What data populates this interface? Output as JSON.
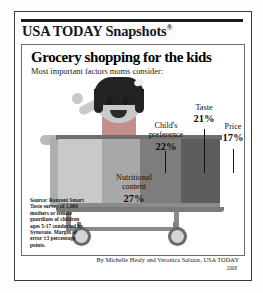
{
  "brand": {
    "logo_text": "USA TODAY Snapshots",
    "registered_mark": "®"
  },
  "headline": "Grocery shopping for the kids",
  "subhead": "Most important factors moms consider:",
  "labels": {
    "nutritional": {
      "line1": "Nutritional",
      "line2": "content",
      "percent": "27%"
    },
    "childs": {
      "line1": "Child's",
      "line2": "preference",
      "percent": "22%"
    },
    "taste": {
      "line1": "Taste",
      "percent": "21%"
    },
    "price": {
      "line1": "Price",
      "percent": "17%"
    }
  },
  "source": "Source: Ronzoni Smart Taste survey of 1,000 mothers or female guardians of children ages 5-17 conducted by Synovate. Margin of error ±3 percentage points.",
  "byline": "By Michelle Healy and Veronica Salazar, USA TODAY",
  "year": "2008",
  "chart_data": {
    "type": "bar",
    "title": "Grocery shopping for the kids",
    "subtitle": "Most important factors moms consider:",
    "categories": [
      "Nutritional content",
      "Child's preference",
      "Taste",
      "Price"
    ],
    "values": [
      27,
      22,
      21,
      17
    ],
    "value_labels": [
      "27%",
      "22%",
      "21%",
      "17%"
    ],
    "unit": "percent",
    "xlabel": "",
    "ylabel": "",
    "ylim": [
      0,
      30
    ],
    "grid": false,
    "legend": "none",
    "orientation": "illustrated-shopping-cart-segments",
    "series_colors": [
      "#c9c9c9",
      "#a8a8a8",
      "#7d7d7d",
      "#5d5d5d"
    ],
    "note": "Segments rendered as bands inside a shopping cart illustration",
    "source": "Ronzoni Smart Taste survey of 1,000 mothers or female guardians of children ages 5-17 conducted by Synovate. Margin of error ±3 percentage points."
  }
}
